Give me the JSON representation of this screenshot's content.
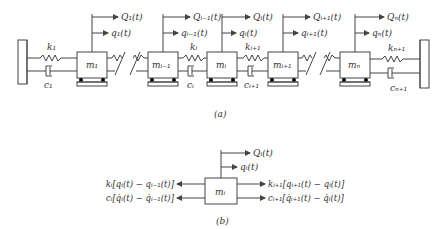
{
  "figure_a": {
    "caption": "(a)",
    "masses": [
      {
        "label": "m₁",
        "Q": "Q₁(t)",
        "q": "q₁(t)"
      },
      {
        "label": "mᵢ₋₁",
        "Q": "Qᵢ₋₁(t)",
        "q": "qᵢ₋₁(t)"
      },
      {
        "label": "mᵢ",
        "Q": "Qᵢ(t)",
        "q": "qᵢ(t)"
      },
      {
        "label": "mᵢ₊₁",
        "Q": "Qᵢ₊₁(t)",
        "q": "qᵢ₊₁(t)"
      },
      {
        "label": "mₙ",
        "Q": "Qₙ(t)",
        "q": "qₙ(t)"
      }
    ],
    "springs": [
      "k₁",
      "kᵢ",
      "kᵢ₊₁",
      "kₙ₊₁"
    ],
    "dampers": [
      "c₁",
      "cᵢ",
      "cᵢ₊₁",
      "cₙ₊₁"
    ]
  },
  "figure_b": {
    "caption": "(b)",
    "mass": "mᵢ",
    "Q": "Qᵢ(t)",
    "q": "qᵢ(t)",
    "left_spring_force": "kᵢ[qᵢ(t) − qᵢ₋₁(t)]",
    "left_damper_force": "cᵢ[q̇ᵢ(t) − q̇ᵢ₋₁(t)]",
    "right_spring_force": "kᵢ₊₁[qᵢ₊₁(t) − qᵢ(t)]",
    "right_damper_force": "cᵢ₊₁[q̇ᵢ₊₁(t) − q̇ᵢ(t)]"
  }
}
